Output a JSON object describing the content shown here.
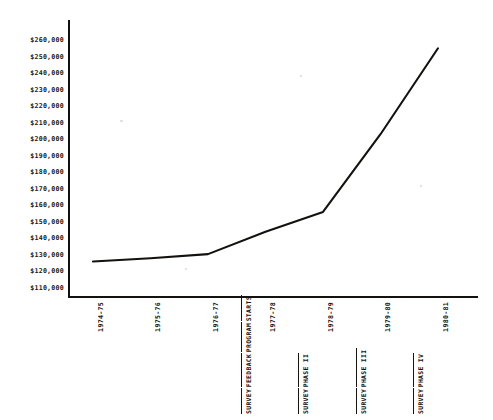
{
  "chart_data": {
    "type": "line",
    "title": "",
    "subtitle": "",
    "xlabel": "",
    "ylabel": "",
    "grid": false,
    "legend": "none",
    "categories": [
      "1974-75",
      "1975-76",
      "1976-77",
      "1977-78",
      "1978-79",
      "1979-80",
      "1980-81"
    ],
    "values": [
      126000,
      128000,
      130500,
      144000,
      156000,
      203000,
      255000
    ],
    "ylim": [
      110000,
      260000
    ],
    "ytick_labels": [
      "$260,000",
      "$250,000",
      "$240,000",
      "$230,000",
      "$220,000",
      "$210,000",
      "$200,000",
      "$190,000",
      "$180,000",
      "$170,000",
      "$160,000",
      "$150,000",
      "$140,000",
      "$130,000",
      "$120,000",
      "$110,000"
    ],
    "ytick_values": [
      260000,
      250000,
      240000,
      230000,
      220000,
      210000,
      200000,
      190000,
      180000,
      170000,
      160000,
      150000,
      140000,
      130000,
      120000,
      110000
    ],
    "series": [
      {
        "name": "cost",
        "values": [
          126000,
          128000,
          130500,
          144000,
          156000,
          203000,
          255000
        ],
        "color": "#14120f"
      }
    ],
    "annotations": [
      {
        "category": "1977-78",
        "lines": [
          "SURVEY",
          "FEEDBACK",
          "PROGRAM",
          "STARTS"
        ]
      },
      {
        "category": "1978-79",
        "lines": [
          "SURVEY",
          "PHASE II"
        ]
      },
      {
        "category": "1979-80",
        "lines": [
          "SURVEY",
          "PHASE III"
        ]
      },
      {
        "category": "1980-81",
        "lines": [
          "SURVEY",
          "PHASE IV"
        ]
      }
    ]
  },
  "colors": {
    "ink": "#14120f",
    "paper": "#ffffff"
  }
}
